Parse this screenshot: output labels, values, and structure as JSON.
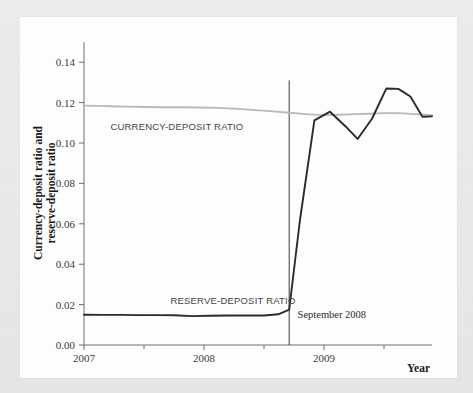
{
  "figure": {
    "background_color": "#e8e8e6",
    "panel_color": "#fdfdfd"
  },
  "chart_data": {
    "type": "line",
    "title": "",
    "subtitle": "",
    "xlabel": "Year",
    "ylabel": "Currency-deposit ratio and reserve-deposit ratio",
    "ylabel_line1": "Currency-deposit ratio and",
    "ylabel_line2": "reserve-deposit ratio",
    "xlim": [
      2007.0,
      2009.9
    ],
    "ylim": [
      0.0,
      0.15
    ],
    "grid": false,
    "legend_position": "inline-labels",
    "x_tick_labels": [
      "2007",
      "2008",
      "2009"
    ],
    "x_tick_values": [
      2007,
      2008,
      2009
    ],
    "x_minor_tick_values": [
      2007.5,
      2008.5,
      2009.5
    ],
    "y_tick_labels": [
      "0.00",
      "0.02",
      "0.04",
      "0.06",
      "0.08",
      "0.10",
      "0.12",
      "0.14"
    ],
    "y_tick_values": [
      0.0,
      0.02,
      0.04,
      0.06,
      0.08,
      0.1,
      0.12,
      0.14
    ],
    "annotations": [
      {
        "text": "September 2008",
        "type": "vertical-line-with-label",
        "x_value": 2008.71,
        "label_x_value": 2008.78,
        "label_y_value": 0.0135,
        "line_y_top": 0.131,
        "line_y_bottom": 0.0,
        "color": "#3a3a3a"
      }
    ],
    "series": [
      {
        "name": "CURRENCY-DEPOSIT RATIO",
        "color": "#b9b9b7",
        "label_x_value": 2007.22,
        "label_y_value": 0.1065,
        "x": [
          2007.0,
          2007.1,
          2007.22,
          2007.35,
          2007.5,
          2007.65,
          2007.8,
          2007.95,
          2008.1,
          2008.25,
          2008.4,
          2008.55,
          2008.71,
          2008.85,
          2009.0,
          2009.12,
          2009.25,
          2009.38,
          2009.5,
          2009.62,
          2009.75,
          2009.9
        ],
        "values": [
          0.1185,
          0.1184,
          0.1182,
          0.118,
          0.1178,
          0.1177,
          0.1177,
          0.1176,
          0.1174,
          0.117,
          0.1164,
          0.1158,
          0.115,
          0.1143,
          0.1138,
          0.114,
          0.1143,
          0.1145,
          0.1148,
          0.1148,
          0.1143,
          0.1138
        ]
      },
      {
        "name": "RESERVE-DEPOSIT RATIO",
        "color": "#2b2b2b",
        "label_x_value": 2007.72,
        "label_y_value": 0.0205,
        "x": [
          2007.0,
          2007.15,
          2007.3,
          2007.45,
          2007.6,
          2007.75,
          2007.9,
          2008.05,
          2008.2,
          2008.35,
          2008.5,
          2008.62,
          2008.71,
          2008.8,
          2008.92,
          2009.05,
          2009.18,
          2009.28,
          2009.4,
          2009.52,
          2009.62,
          2009.72,
          2009.82,
          2009.9
        ],
        "values": [
          0.015,
          0.0149,
          0.0149,
          0.0148,
          0.0148,
          0.0147,
          0.0143,
          0.0145,
          0.0146,
          0.0146,
          0.0146,
          0.0152,
          0.0175,
          0.062,
          0.1112,
          0.1155,
          0.1082,
          0.102,
          0.112,
          0.127,
          0.1268,
          0.123,
          0.113,
          0.1132
        ]
      }
    ]
  }
}
